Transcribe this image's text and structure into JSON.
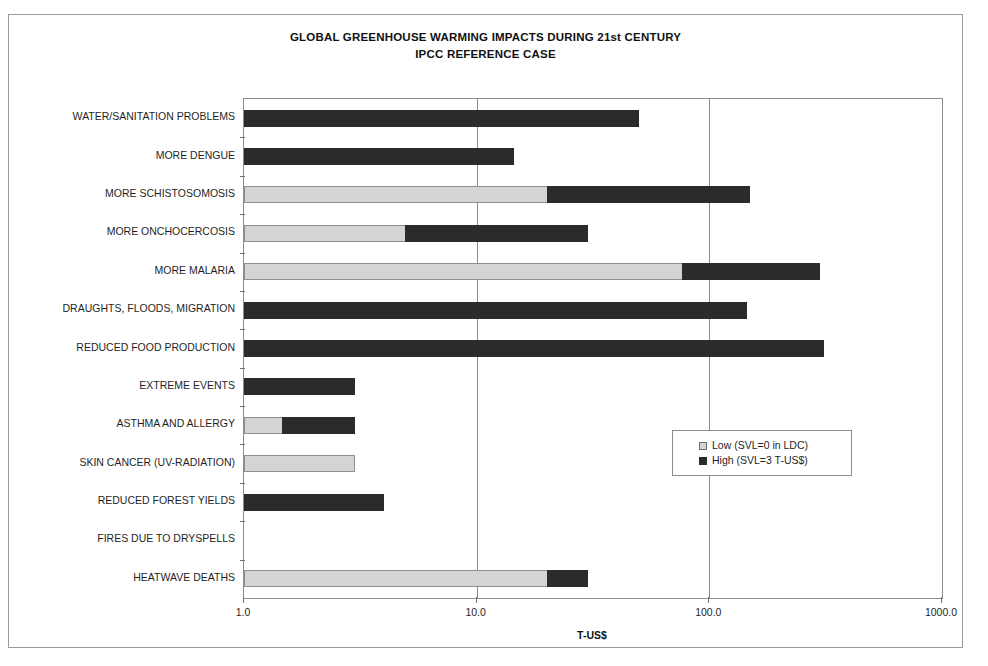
{
  "chart_data": {
    "type": "bar",
    "orientation": "horizontal",
    "stacked": true,
    "title": "GLOBAL GREENHOUSE WARMING IMPACTS DURING 21st CENTURY",
    "subtitle": "IPCC REFERENCE CASE",
    "xlabel": "T-US$",
    "ylabel": "",
    "xscale": "log",
    "xlim": [
      1.0,
      1000.0
    ],
    "xticks": [
      1.0,
      10.0,
      100.0,
      1000.0
    ],
    "xtick_labels": [
      "1.0",
      "10.0",
      "100.0",
      "1000.0"
    ],
    "grid": true,
    "legend_position": "center-right",
    "categories": [
      "WATER/SANITATION PROBLEMS",
      "MORE DENGUE",
      "MORE SCHISTOSOMOSIS",
      "MORE ONCHOCERCOSIS",
      "MORE MALARIA",
      "DRAUGHTS, FLOODS, MIGRATION",
      "REDUCED FOOD PRODUCTION",
      "EXTREME EVENTS",
      "ASTHMA AND ALLERGY",
      "SKIN CANCER (UV-RADIATION)",
      "REDUCED FOREST YIELDS",
      "FIRES DUE TO DRYSPELLS",
      "HEATWAVE DEATHS"
    ],
    "series": [
      {
        "name": "Low (SVL=0 in LDC)",
        "color": "#d4d4d4",
        "values": [
          1.0,
          1.0,
          20.0,
          4.9,
          76.0,
          1.0,
          1.0,
          1.0,
          1.45,
          3.0,
          1.0,
          1.0,
          20.0
        ]
      },
      {
        "name": "High (SVL=3 T-US$)",
        "color": "#2b2b2b",
        "values": [
          50.0,
          14.5,
          150.0,
          30.0,
          300.0,
          145.0,
          310.0,
          3.0,
          3.0,
          3.0,
          4.0,
          1.0,
          30.0
        ]
      }
    ]
  },
  "legend": {
    "entries": [
      {
        "label": "Low (SVL=0 in LDC)",
        "swatch": "low"
      },
      {
        "label": "High (SVL=3 T-US$)",
        "swatch": "high"
      }
    ]
  }
}
